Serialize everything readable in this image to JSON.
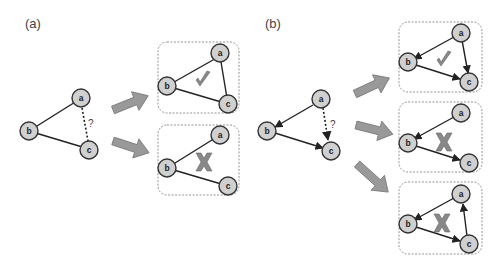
{
  "panels": {
    "a": {
      "label": "(a)"
    },
    "b": {
      "label": "(b)"
    }
  },
  "nodes": {
    "a": "a",
    "b": "b",
    "c": "c"
  },
  "question_mark": "?",
  "colors": {
    "node_fill": "#d0d0d0",
    "node_stroke": "#333333",
    "edge": "#222222",
    "arrow_fill": "#999999",
    "arrow_stroke": "#777777",
    "mark": "#777777",
    "box": "#888888"
  },
  "panel_a": {
    "query_graph": {
      "edges": [
        "b-a",
        "b-c"
      ],
      "query_edge": "a-c (dashed, ?)"
    },
    "outcomes": [
      {
        "edges": [
          "b-a",
          "b-c",
          "a-c"
        ],
        "mark": "check",
        "valid": true
      },
      {
        "edges": [
          "b-a",
          "b-c"
        ],
        "mark": "cross",
        "valid": false
      }
    ]
  },
  "panel_b": {
    "query_graph": {
      "edges": [
        "a->b",
        "b->c"
      ],
      "query_edge": "a->c (dashed, ?)"
    },
    "outcomes": [
      {
        "edges": [
          "a->b",
          "b->c",
          "a->c"
        ],
        "mark": "check",
        "valid": true
      },
      {
        "edges": [
          "a->b",
          "b->c"
        ],
        "mark": "cross",
        "valid": false
      },
      {
        "edges": [
          "a->b",
          "b->c",
          "c->a"
        ],
        "mark": "cross",
        "valid": false
      }
    ]
  }
}
